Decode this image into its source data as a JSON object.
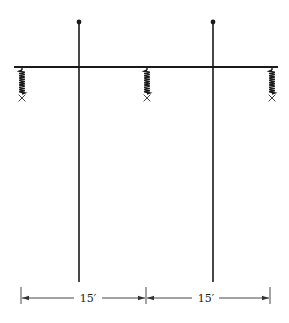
{
  "diagram": {
    "type": "beam-with-supports",
    "colors": {
      "ink": "#1a1a1a",
      "background": "#ffffff"
    },
    "posts": [
      {
        "id": "post-left",
        "top_marker": "dot"
      },
      {
        "id": "post-right",
        "top_marker": "dot"
      }
    ],
    "springs": [
      {
        "id": "spring-left",
        "end_marker": "x"
      },
      {
        "id": "spring-middle",
        "end_marker": "x"
      },
      {
        "id": "spring-right",
        "end_marker": "x"
      }
    ],
    "dimensions": [
      {
        "label": "15′"
      },
      {
        "label": "15′"
      }
    ]
  }
}
